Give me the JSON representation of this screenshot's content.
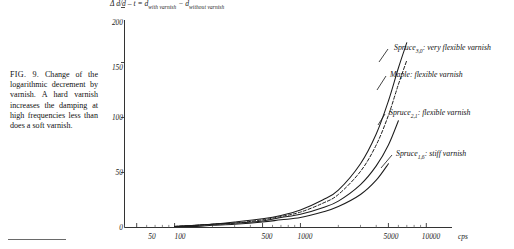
{
  "figure": {
    "number": "FIG. 9.",
    "caption": "Change of the logarithmic decrement by varnish. A hard varnish increases the damping at high frequencies less than does a soft varnish.",
    "caption_full": "FIG. 9. Change of the logarithmic decrement by varnish. A hard varnish increases the damping at high frequencies less than does a soft varnish."
  },
  "chart_data": {
    "type": "line",
    "title": "",
    "ylabel_expression": {
      "delta": "Δ",
      "fraction_numerator": "d",
      "fraction_denominator": "d",
      "lhs": "Δ d/d – t =",
      "rhs_1": "d",
      "rhs_1_sub": "with varnish",
      "minus": "−",
      "rhs_2": "d",
      "rhs_2_sub": "without varnish",
      "plain": "Δ d/d - t = d with varnish - d without varnish"
    },
    "xlabel": "",
    "x_unit": "cps",
    "x_scale": "log",
    "xlim": [
      40,
      16000
    ],
    "ylim": [
      0,
      210
    ],
    "yticks": [
      0,
      50,
      100,
      150,
      200
    ],
    "ytick_labels": [
      "0",
      "50",
      "100",
      "150",
      "200"
    ],
    "xticks": [
      50,
      100,
      500,
      1000,
      5000,
      10000
    ],
    "xtick_labels": [
      "50",
      "100",
      "500",
      "1000",
      "5000",
      "10000"
    ],
    "grid": false,
    "legend_position": "inline-right",
    "series": [
      {
        "name": "Spruce 3,0: very flexible varnish",
        "label_text": "Spruce",
        "label_sub": "3,0",
        "label_suffix": ": very flexible varnish",
        "style": "solid",
        "x": [
          100,
          150,
          200,
          300,
          500,
          700,
          1000,
          1500,
          2000,
          3000,
          4000,
          5000,
          6000,
          7000
        ],
        "y": [
          1,
          2,
          3,
          5,
          8,
          11,
          16,
          25,
          34,
          58,
          85,
          115,
          145,
          168
        ]
      },
      {
        "name": "Maple: flexible varnish",
        "label_text": "Maple",
        "label_sub": "",
        "label_suffix": ": flexible varnish",
        "style": "dashed",
        "x": [
          100,
          150,
          200,
          300,
          500,
          700,
          1000,
          1500,
          2000,
          3000,
          4000,
          5000,
          6000,
          7000
        ],
        "y": [
          1,
          2,
          3,
          4,
          7,
          10,
          14,
          22,
          30,
          51,
          75,
          102,
          130,
          152
        ]
      },
      {
        "name": "Spruce 2,1: flexible varnish",
        "label_text": "Spruce",
        "label_sub": "2,1",
        "label_suffix": ": flexible varnish",
        "style": "solid",
        "x": [
          100,
          150,
          200,
          300,
          500,
          700,
          1000,
          1500,
          2000,
          3000,
          4000,
          5000,
          6000
        ],
        "y": [
          1,
          2,
          3,
          4,
          6,
          9,
          12,
          18,
          24,
          39,
          56,
          75,
          97
        ]
      },
      {
        "name": "Spruce 1,6: stiff varnish",
        "label_text": "Spruce",
        "label_sub": "1,6",
        "label_suffix": ": stiff varnish",
        "style": "solid",
        "x": [
          100,
          150,
          200,
          300,
          500,
          700,
          1000,
          1500,
          2000,
          3000,
          4000,
          5000
        ],
        "y": [
          1,
          1,
          2,
          3,
          5,
          7,
          9,
          14,
          19,
          30,
          43,
          58
        ]
      }
    ]
  }
}
